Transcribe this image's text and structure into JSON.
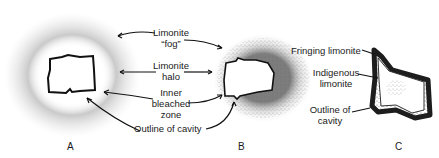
{
  "figure": {
    "panels": [
      {
        "id": "A",
        "label": "A"
      },
      {
        "id": "B",
        "label": "B"
      },
      {
        "id": "C",
        "label": "C"
      }
    ],
    "labels_ab": {
      "fog": [
        "Limonite",
        "“fog”"
      ],
      "halo": [
        "Limonite",
        "halo"
      ],
      "bleached": [
        "Inner",
        "bleached",
        "zone"
      ],
      "outline": "Outline of cavity"
    },
    "labels_c": {
      "fringing": "Fringing limonite",
      "indigenous": [
        "Indigenous",
        "limonite"
      ],
      "outline": [
        "Outline of",
        "cavity"
      ]
    },
    "colors": {
      "ink": "#1a1a1a",
      "stipple": "#555555",
      "background": "#ffffff"
    }
  }
}
